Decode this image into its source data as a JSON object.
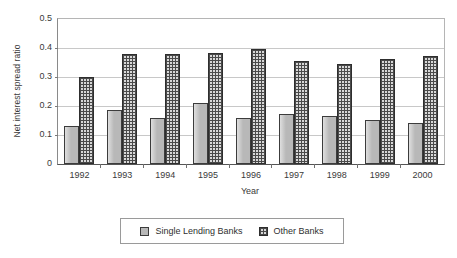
{
  "chart_data": {
    "type": "bar",
    "title": "",
    "xlabel": "Year",
    "ylabel": "Net interest spread ratio",
    "ylim": [
      0,
      0.5
    ],
    "yticks": [
      "0.5",
      "0.4",
      "0.3",
      "0.2",
      "0.1",
      "0"
    ],
    "ytick_values": [
      0.5,
      0.4,
      0.3,
      0.2,
      0.1,
      0
    ],
    "grid": "horizontal",
    "legend_position": "bottom",
    "categories": [
      "1992",
      "1993",
      "1994",
      "1995",
      "1996",
      "1997",
      "1998",
      "1999",
      "2000"
    ],
    "series": [
      {
        "name": "Single Lending Banks",
        "color": "#b8b8b8",
        "pattern": "solid-gray",
        "values": [
          0.13,
          0.185,
          0.16,
          0.212,
          0.16,
          0.172,
          0.165,
          0.152,
          0.142
        ]
      },
      {
        "name": "Other Banks",
        "color": "#d8d8d8",
        "pattern": "grid-crosshatch",
        "values": [
          0.299,
          0.378,
          0.378,
          0.384,
          0.395,
          0.355,
          0.344,
          0.362,
          0.373
        ]
      }
    ]
  },
  "legend": {
    "entries": [
      {
        "label": "Single Lending Banks"
      },
      {
        "label": "Other Banks"
      }
    ]
  },
  "colors": {
    "series_0": "#b8b8b8",
    "series_1": "#d8d8d8",
    "bar_outline": "#3c3c3c",
    "gridline": "#c8c8c8",
    "axis": "#555555",
    "background": "#ffffff",
    "text": "#3a3a3a"
  }
}
